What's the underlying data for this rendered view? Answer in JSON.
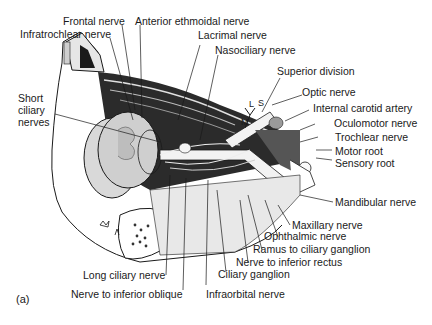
{
  "figure": {
    "panel_label": "(a)",
    "labels": {
      "frontal_nerve": "Frontal nerve",
      "infratrochlear_nerve": "Infratrochlear nerve",
      "anterior_ethmoidal_nerve": "Anterior ethmoidal nerve",
      "lacrimal_nerve": "Lacrimal nerve",
      "nasociliary_nerve": "Nasociliary nerve",
      "superior_division": "Superior division",
      "optic_nerve": "Optic nerve",
      "internal_carotid_artery": "Internal carotid artery",
      "oculomotor_nerve": "Oculomotor nerve",
      "trochlear_nerve": "Trochlear nerve",
      "motor_root": "Motor root",
      "sensory_root": "Sensory root",
      "mandibular_nerve": "Mandibular nerve",
      "maxillary_nerve": "Maxillary nerve",
      "ophthalmic_nerve": "Ophthalmic nerve",
      "ramus_to_ciliary_ganglion": "Ramus to ciliary ganglion",
      "nerve_to_inferior_rectus": "Nerve to inferior rectus",
      "ciliary_ganglion": "Ciliary ganglion",
      "infraorbital_nerve": "Infraorbital nerve",
      "long_ciliary_nerve": "Long ciliary nerve",
      "nerve_to_inferior_oblique": "Nerve to inferior oblique",
      "short_ciliary_nerves": "Short ciliary nerves"
    },
    "branch_markers": {
      "m": "M",
      "l": "L",
      "s": "S"
    },
    "colors": {
      "ink": "#1a1a1a",
      "dark_fill": "#2b2b2b",
      "mid_fill": "#8c8c8c",
      "light_fill": "#d9d9d9",
      "background": "#ffffff"
    }
  }
}
